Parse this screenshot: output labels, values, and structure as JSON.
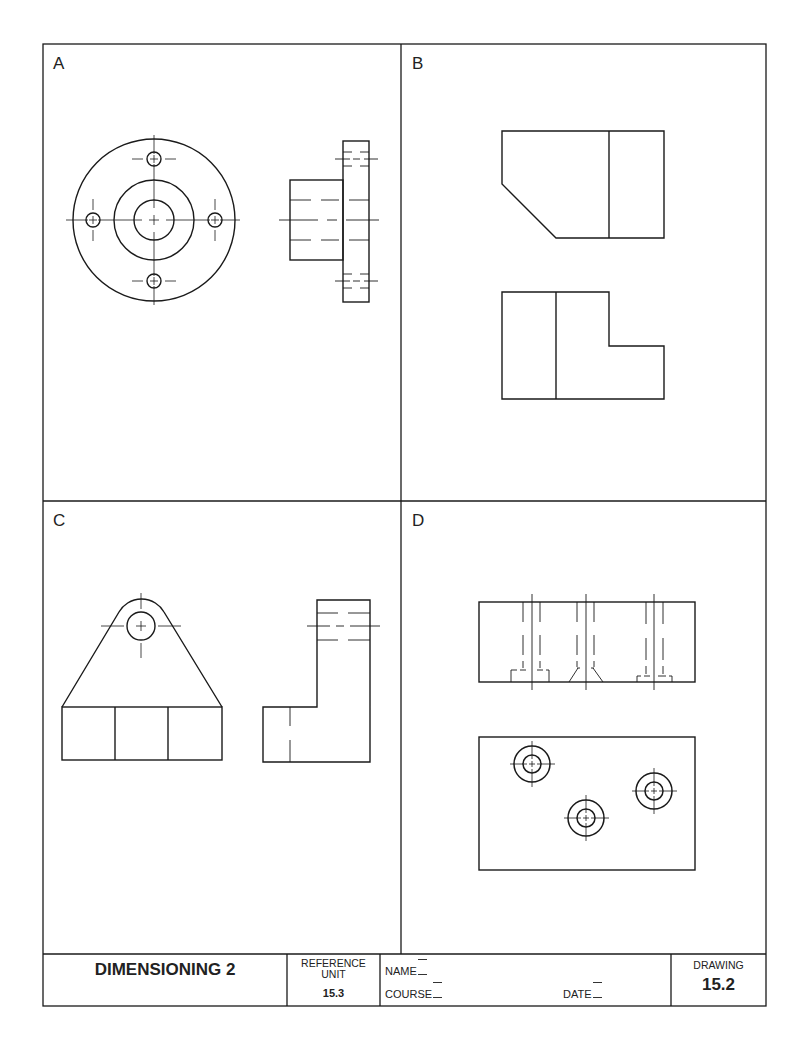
{
  "panels": {
    "a": {
      "label": "A"
    },
    "b": {
      "label": "B"
    },
    "c": {
      "label": "C"
    },
    "d": {
      "label": "D"
    }
  },
  "title_block": {
    "title": "DIMENSIONING 2",
    "reference_label_line1": "REFERENCE",
    "reference_label_line2": "UNIT",
    "reference_unit": "15.3",
    "name_label": "NAME",
    "course_label": "COURSE",
    "date_label": "DATE",
    "drawing_label": "DRAWING",
    "drawing_number": "15.2"
  },
  "colors": {
    "line": "#1a1a1a",
    "background": "#ffffff"
  }
}
